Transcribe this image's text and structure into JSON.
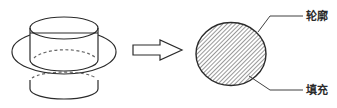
{
  "diagram": {
    "type": "illustration",
    "description_elements": [
      "3d-solid",
      "arrow",
      "cross-section"
    ],
    "labels": {
      "outline": "轮廓",
      "fill": "填充"
    },
    "colors": {
      "stroke": "#2b2b2b",
      "hatch": "#444444",
      "dashed": "#666666",
      "background": "#ffffff"
    }
  }
}
